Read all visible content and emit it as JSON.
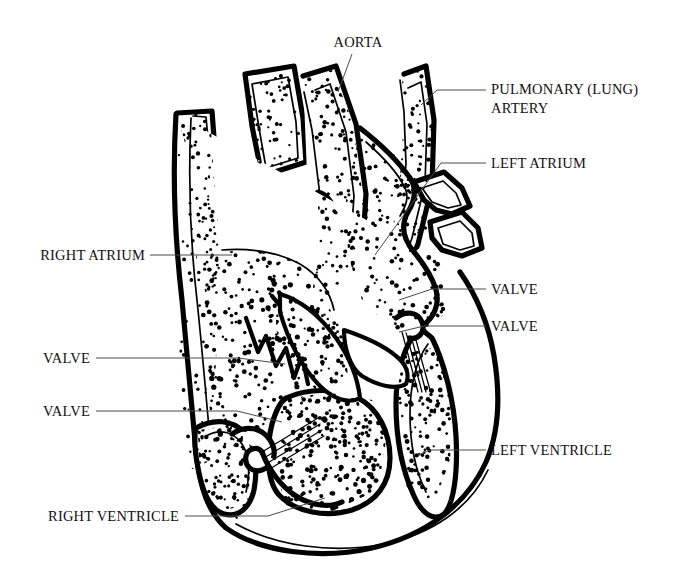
{
  "diagram": {
    "style": "black-and-white line art with stipple shading",
    "background_color": "#ffffff",
    "ink_color": "#000000",
    "leader_color": "#4a4a4a",
    "width": 673,
    "height": 582
  },
  "labels": [
    {
      "id": "aorta",
      "text": "AORTA",
      "anchor": "middle",
      "text_x": 358,
      "text_y": 47,
      "leader": "M 352 54 L 338 92"
    },
    {
      "id": "pulmonary-artery",
      "text_lines": [
        "PULMONARY (LUNG)",
        "ARTERY"
      ],
      "text": "PULMONARY (LUNG) ARTERY",
      "anchor": "start",
      "text_x": 491,
      "text_y": 94,
      "line_height": 19,
      "leader": "M 486 90 L 437 90 L 421 105"
    },
    {
      "id": "left-atrium",
      "text": "LEFT ATRIUM",
      "anchor": "start",
      "text_x": 491,
      "text_y": 168,
      "leader": "M 486 163 L 441 163 L 375 255"
    },
    {
      "id": "valve-right-upper",
      "text": "VALVE",
      "anchor": "start",
      "text_x": 491,
      "text_y": 294,
      "leader": "M 486 289 L 432 289 L 399 300"
    },
    {
      "id": "valve-right-lower",
      "text": "VALVE",
      "anchor": "start",
      "text_x": 491,
      "text_y": 331,
      "leader": "M 486 326 L 424 326 L 399 332"
    },
    {
      "id": "right-atrium",
      "text": "RIGHT ATRIUM",
      "anchor": "end",
      "text_x": 145,
      "text_y": 260,
      "leader": "M 150 255 L 232 255"
    },
    {
      "id": "valve-left-upper",
      "text": "VALVE",
      "anchor": "end",
      "text_x": 90,
      "text_y": 363,
      "leader": "M 96 358 L 238 358 L 285 364"
    },
    {
      "id": "valve-left-lower",
      "text": "VALVE",
      "anchor": "end",
      "text_x": 90,
      "text_y": 416,
      "leader": "M 96 411 L 237 411 L 282 422"
    },
    {
      "id": "left-ventricle",
      "text": "LEFT VENTRICLE",
      "anchor": "start",
      "text_x": 491,
      "text_y": 455,
      "leader": "M 486 450 L 430 450 L 418 455"
    },
    {
      "id": "right-ventricle",
      "text": "RIGHT VENTRICLE",
      "anchor": "end",
      "text_x": 179,
      "text_y": 521,
      "leader": "M 185 516 L 268 516 L 325 498"
    }
  ],
  "structures": [
    {
      "id": "superior-vena-cava",
      "name": "superior vena cava"
    },
    {
      "id": "aorta-vessel",
      "name": "aorta vessel"
    },
    {
      "id": "pulmonary-artery-vessel",
      "name": "pulmonary artery vessel"
    },
    {
      "id": "pulmonary-veins",
      "name": "pulmonary veins"
    },
    {
      "id": "right-atrium-chamber",
      "name": "right atrium chamber"
    },
    {
      "id": "left-atrium-chamber",
      "name": "left atrium chamber"
    },
    {
      "id": "right-ventricle-chamber",
      "name": "right ventricle chamber"
    },
    {
      "id": "left-ventricle-chamber",
      "name": "left ventricle chamber"
    },
    {
      "id": "tricuspid-valve",
      "name": "tricuspid valve leaflets"
    },
    {
      "id": "mitral-valve",
      "name": "mitral valve leaflets"
    },
    {
      "id": "papillary-muscle",
      "name": "papillary muscle"
    },
    {
      "id": "chordae-tendineae",
      "name": "chordae tendineae"
    },
    {
      "id": "septum",
      "name": "interventricular septum"
    }
  ]
}
